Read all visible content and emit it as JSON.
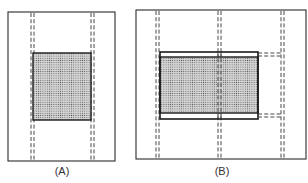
{
  "figure": {
    "panels": [
      {
        "id": "A",
        "label": "(A)",
        "frame": {
          "x": 8,
          "y": 12,
          "w": 107,
          "h": 149
        },
        "dashed_columns_x": [
          31,
          34,
          91,
          94
        ],
        "shaded_rect": {
          "x": 33,
          "y": 53,
          "w": 58,
          "h": 67
        },
        "label_pos": {
          "x": 62,
          "y": 165
        }
      },
      {
        "id": "B",
        "label": "(B)",
        "frame": {
          "x": 136,
          "y": 10,
          "w": 170,
          "h": 149
        },
        "dashed_columns_x": [
          156,
          159,
          217,
          220,
          281,
          284
        ],
        "outer_rect": {
          "x": 160,
          "y": 52,
          "w": 98,
          "h": 67
        },
        "shaded_rect": {
          "x": 160,
          "y": 57,
          "w": 98,
          "h": 56
        },
        "horizontal_dashes": [
          {
            "x1": 258,
            "x2": 282,
            "y": 53
          },
          {
            "x1": 258,
            "x2": 282,
            "y": 56
          },
          {
            "x1": 258,
            "x2": 282,
            "y": 114
          },
          {
            "x1": 258,
            "x2": 282,
            "y": 117
          }
        ],
        "label_pos": {
          "x": 222,
          "y": 165
        }
      }
    ],
    "colors": {
      "line": "#1a1a1a",
      "shade_bg": "#d8d8d8",
      "shade_dot": "#555555",
      "background": "#ffffff"
    }
  }
}
